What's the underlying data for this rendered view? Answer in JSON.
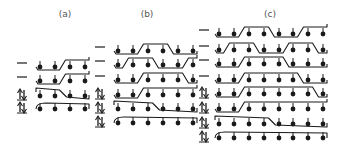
{
  "figure": {
    "panels": [
      {
        "id": "a",
        "label": "(a)",
        "label_x": 65,
        "label_y": 17,
        "dot_x": [
          40,
          55,
          70,
          85
        ],
        "rows": [
          {
            "y": 66,
            "marker": "dash",
            "path": "wave",
            "period": 2,
            "phase": 0
          },
          {
            "y": 80,
            "marker": "dash",
            "path": "wave",
            "period": 3,
            "phase": 1
          },
          {
            "y": 95,
            "marker": "spin-pair",
            "path": "step",
            "step_at": 1.5
          },
          {
            "y": 108,
            "marker": "spin-pair",
            "path": "flat"
          }
        ]
      },
      {
        "id": "b",
        "label": "(b)",
        "label_x": 147,
        "label_y": 17,
        "dot_x": [
          118,
          133,
          148,
          163,
          178,
          193
        ],
        "rows": [
          {
            "y": 50,
            "marker": "dash",
            "path": "wave",
            "period": 2,
            "phase": 0
          },
          {
            "y": 64,
            "marker": "dash",
            "path": "wave",
            "period": 2,
            "phase": 1
          },
          {
            "y": 79,
            "marker": "dash",
            "path": "wave",
            "period": 3,
            "phase": 1
          },
          {
            "y": 94,
            "marker": "spin-pair",
            "path": "wave",
            "period": 4,
            "phase": 2
          },
          {
            "y": 108,
            "marker": "spin-pair",
            "path": "step",
            "step_at": 2.5
          },
          {
            "y": 122,
            "marker": "spin-pair",
            "path": "flat"
          }
        ]
      },
      {
        "id": "c",
        "label": "(c)",
        "label_x": 270,
        "label_y": 17,
        "dot_x": [
          219,
          234,
          249,
          264,
          279,
          293,
          308,
          323
        ],
        "rows": [
          {
            "y": 33,
            "marker": "dash",
            "path": "wave",
            "period": 2,
            "phase": 0
          },
          {
            "y": 49,
            "marker": "dash",
            "path": "wave",
            "period": 2,
            "phase": 1
          },
          {
            "y": 63,
            "marker": "dash",
            "path": "wave",
            "period": 3,
            "phase": 1
          },
          {
            "y": 79,
            "marker": "dash",
            "path": "wave",
            "period": 4,
            "phase": 2
          },
          {
            "y": 93,
            "marker": "spin-pair",
            "path": "wave",
            "period": 5,
            "phase": 3
          },
          {
            "y": 108,
            "marker": "spin-pair",
            "path": "wave",
            "period": 6,
            "phase": 4
          },
          {
            "y": 123,
            "marker": "spin-pair",
            "path": "step",
            "step_at": 3.5
          },
          {
            "y": 137,
            "marker": "spin-pair",
            "path": "flat"
          }
        ]
      }
    ],
    "marker_x": {
      "a": 22,
      "b": 100,
      "c": 204
    },
    "colors": {
      "ink": "#1a1a1a",
      "label": "#555555",
      "background": "#ffffff"
    }
  }
}
